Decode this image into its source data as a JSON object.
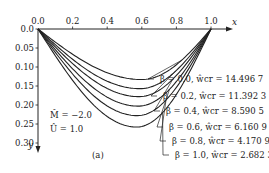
{
  "chart_data": {
    "type": "line",
    "title": "",
    "caption": "(a)",
    "xlabel": "x",
    "ylabel": "y",
    "xlim": [
      0.0,
      1.0
    ],
    "ylim": [
      0.0,
      0.3
    ],
    "y_inverted": true,
    "x_axis_position": "top",
    "x_ticks": [
      "0.0",
      "0.2",
      "0.4",
      "0.6",
      "0.8",
      "1.0"
    ],
    "y_ticks": [
      "0.0",
      "0.05",
      "0.10",
      "0.15",
      "0.20",
      "0.25",
      "0.30"
    ],
    "grid": false,
    "annotations": [
      {
        "id": "M",
        "text": "ĤM̂ = −2.0",
        "display": "M̂ = −2.0"
      },
      {
        "id": "U",
        "display": "Û = 1.0"
      }
    ],
    "params": {
      "M_hat": "-2.0",
      "U_hat": "1.0"
    },
    "series": [
      {
        "name": "β = 0.0, ŵcr = 14.496 7",
        "beta": 0.0,
        "w_cr": 14.4967,
        "x_min": 0.6,
        "y_max": 0.133
      },
      {
        "name": "β = 0.2, ŵcr = 11.392 3",
        "beta": 0.2,
        "w_cr": 11.3923,
        "x_min": 0.59,
        "y_max": 0.157
      },
      {
        "name": "β = 0.4, ŵcr = 8.590 5",
        "beta": 0.4,
        "w_cr": 8.5905,
        "x_min": 0.585,
        "y_max": 0.178
      },
      {
        "name": "β = 0.6, ŵcr = 6.160 9",
        "beta": 0.6,
        "w_cr": 6.1609,
        "x_min": 0.58,
        "y_max": 0.203
      },
      {
        "name": "β = 0.8, ŵcr = 4.170 9",
        "beta": 0.8,
        "w_cr": 4.1709,
        "x_min": 0.575,
        "y_max": 0.228
      },
      {
        "name": "β = 1.0, ŵcr = 2.682 3",
        "beta": 1.0,
        "w_cr": 2.6823,
        "x_min": 0.57,
        "y_max": 0.258
      }
    ]
  },
  "labels": {
    "x_axis": "x",
    "y_axis": "y",
    "caption": "(a)",
    "ann_m": "M̂ = −2.0",
    "ann_u": "Û = 1.0",
    "legend": [
      "β = 0.0,  ŵcr = 14.496 7",
      "β = 0.2,  ŵcr = 11.392 3",
      "β = 0.4,  ŵcr = 8.590 5",
      "β = 0.6,  ŵcr = 6.160 9",
      "β = 0.8,  ŵcr = 4.170 9",
      "β = 1.0,  ŵcr = 2.682 3"
    ]
  }
}
